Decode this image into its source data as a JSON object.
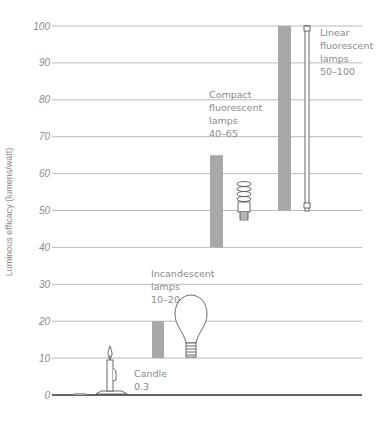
{
  "chart_data": {
    "type": "bar",
    "title": "",
    "xlabel": "",
    "ylabel": "Luminous efficacy (lumens/watt)",
    "ylim": [
      0,
      100
    ],
    "yticks": [
      0,
      10,
      20,
      30,
      40,
      50,
      60,
      70,
      80,
      90,
      100
    ],
    "grid": true,
    "legend": "none",
    "categories": [
      "Candle",
      "Incandescent lamps",
      "Compact fluorescent lamps",
      "Linear fluorescent lamps"
    ],
    "series": [
      {
        "name": "Luminous efficacy range",
        "ranges": [
          [
            0,
            0.3
          ],
          [
            10,
            20
          ],
          [
            40,
            65
          ],
          [
            50,
            100
          ]
        ]
      }
    ],
    "annotations": [
      {
        "category": "Candle",
        "lines": [
          "Candle",
          "0.3"
        ]
      },
      {
        "category": "Incandescent lamps",
        "lines": [
          "Incandescent",
          "lamps",
          "10–20"
        ]
      },
      {
        "category": "Compact fluorescent lamps",
        "lines": [
          "Compact",
          "fluorescent",
          "lamps",
          "40–65"
        ]
      },
      {
        "category": "Linear fluorescent lamps",
        "lines": [
          "Linear",
          "fluorescent",
          "lamps",
          "50–100"
        ]
      }
    ]
  },
  "colors": {
    "bar": "#a8a8a8",
    "grid": "#8c8c8c",
    "baseline": "#333333",
    "text": "#8a8a8a",
    "icon": "#444444"
  }
}
